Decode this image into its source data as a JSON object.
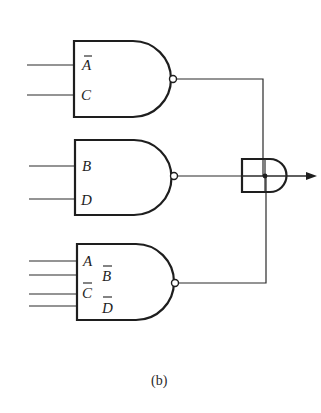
{
  "figure": {
    "caption": "(b)",
    "gates": [
      {
        "id": "nand-1",
        "type": "NAND",
        "inputs": [
          {
            "label": "A",
            "negated": true
          },
          {
            "label": "C",
            "negated": false
          }
        ]
      },
      {
        "id": "nand-2",
        "type": "NAND",
        "inputs": [
          {
            "label": "B",
            "negated": false
          },
          {
            "label": "D",
            "negated": false
          }
        ]
      },
      {
        "id": "nand-3",
        "type": "NAND",
        "inputs": [
          {
            "label": "A",
            "negated": false
          },
          {
            "label": "B",
            "negated": true
          },
          {
            "label": "C",
            "negated": true
          },
          {
            "label": "D",
            "negated": true
          }
        ]
      },
      {
        "id": "combiner",
        "type": "AND",
        "inputs_from": [
          "nand-1",
          "nand-2",
          "nand-3"
        ]
      }
    ],
    "colors": {
      "ink": "#1e1e1e",
      "background": "#ffffff"
    }
  }
}
